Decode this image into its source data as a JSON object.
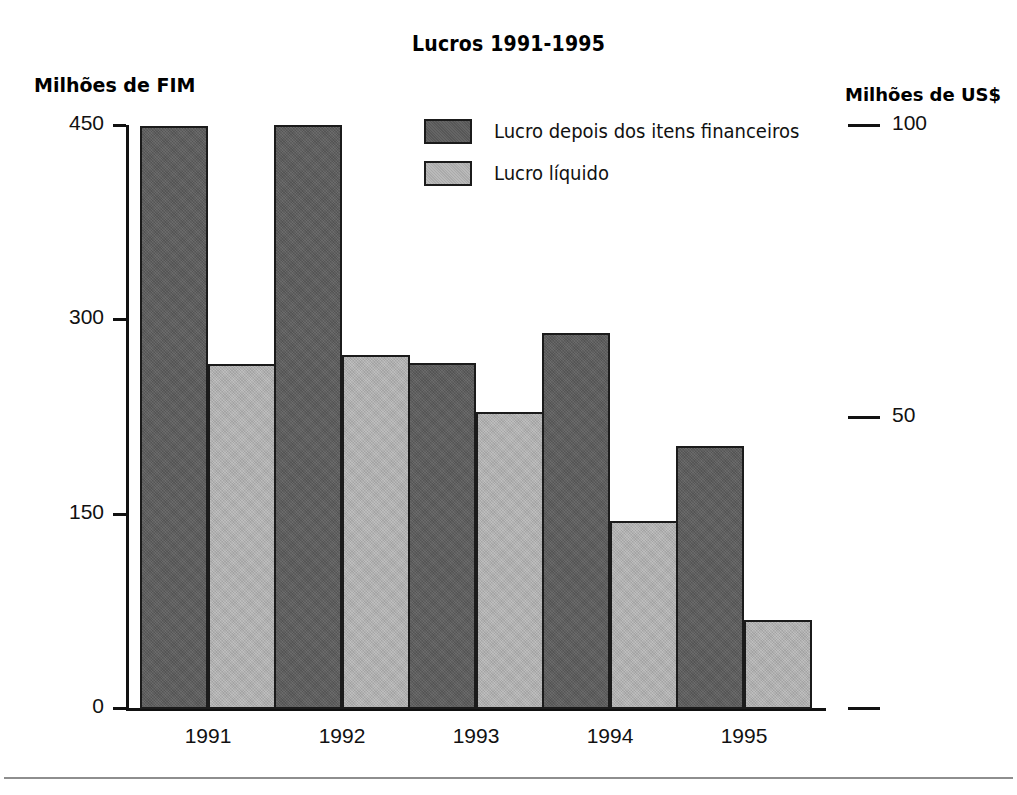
{
  "chart_data": {
    "type": "bar",
    "title": "Lucros 1991-1995",
    "xlabel": "",
    "ylabel": "Milhões de FIM",
    "y2label": "Milhões de US$",
    "categories": [
      "1991",
      "1992",
      "1993",
      "1994",
      "1995"
    ],
    "series": [
      {
        "name": "Lucro depois dos itens financeiros",
        "color": "#5c5c5c",
        "values": [
          450,
          451,
          267,
          290,
          203
        ]
      },
      {
        "name": "Lucro líquido",
        "color": "#b3b3b3",
        "values": [
          266,
          273,
          229,
          145,
          69
        ]
      }
    ],
    "ylim": [
      0,
      450
    ],
    "yticks": [
      0,
      150,
      300,
      450
    ],
    "ytick_labels": [
      "0",
      "150",
      "300",
      "450"
    ],
    "y2lim": [
      0,
      100
    ],
    "y2ticks": [
      0,
      50,
      100
    ],
    "y2tick_labels": [
      "",
      "50",
      "100"
    ],
    "grid": false,
    "legend_position": "upper center"
  },
  "title": "Lucros 1991-1995",
  "axes": {
    "left_title": "Milhões de FIM",
    "right_title": "Milhões de US$",
    "y_labels": [
      "450",
      "300",
      "150",
      "0"
    ],
    "x_labels": [
      "1991",
      "1992",
      "1993",
      "1994",
      "1995"
    ],
    "right_labels": [
      "100",
      "50",
      ""
    ]
  },
  "legend": {
    "items": [
      {
        "label": "Lucro depois dos itens financeiros",
        "swatch": "dark-gray-swatch"
      },
      {
        "label": "Lucro líquido",
        "swatch": "light-gray-swatch"
      }
    ]
  },
  "colors": {
    "series_dark": "#5c5c5c",
    "series_light": "#b3b3b3",
    "axis": "#111111",
    "background": "#ffffff",
    "rule": "#8e8e8e"
  }
}
